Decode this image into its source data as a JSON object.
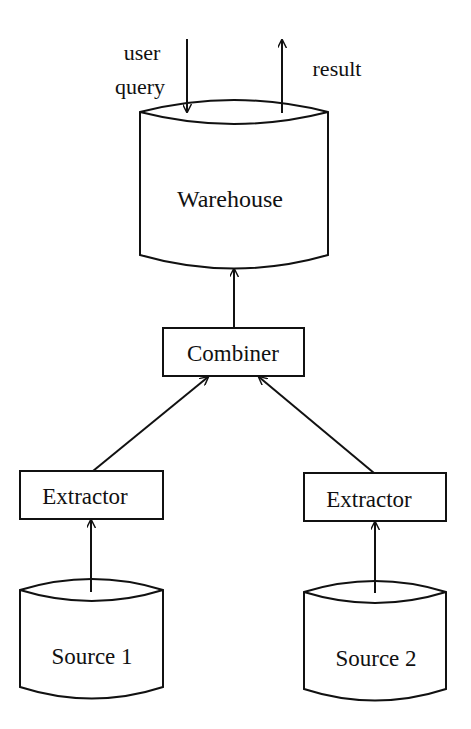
{
  "diagram": {
    "type": "data-warehouse-architecture",
    "nodes": {
      "warehouse": {
        "label": "Warehouse",
        "shape": "cylinder"
      },
      "combiner": {
        "label": "Combiner",
        "shape": "rectangle"
      },
      "extractor_1": {
        "label": "Extractor",
        "shape": "rectangle"
      },
      "extractor_2": {
        "label": "Extractor",
        "shape": "rectangle"
      },
      "source_1": {
        "label": "Source 1",
        "shape": "cylinder"
      },
      "source_2": {
        "label": "Source 2",
        "shape": "cylinder"
      }
    },
    "annotations": {
      "user_query_line1": "user",
      "user_query_line2": "query",
      "result": "result"
    },
    "edges": [
      {
        "from": "user query",
        "to": "warehouse"
      },
      {
        "from": "warehouse",
        "to": "result"
      },
      {
        "from": "combiner",
        "to": "warehouse"
      },
      {
        "from": "extractor_1",
        "to": "combiner"
      },
      {
        "from": "extractor_2",
        "to": "combiner"
      },
      {
        "from": "source_1",
        "to": "extractor_1"
      },
      {
        "from": "source_2",
        "to": "extractor_2"
      }
    ],
    "colors": {
      "stroke": "#111111",
      "background": "#ffffff"
    }
  }
}
